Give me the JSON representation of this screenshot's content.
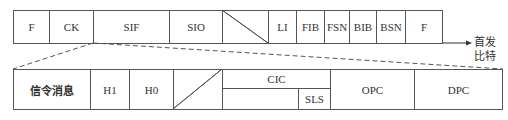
{
  "diagram": {
    "top_frame": {
      "fields": [
        {
          "label": "F"
        },
        {
          "label": "CK"
        },
        {
          "label": "SIF"
        },
        {
          "label": "SIO"
        },
        {
          "label": ""
        },
        {
          "label": "LI"
        },
        {
          "label": "FIB"
        },
        {
          "label": "FSN"
        },
        {
          "label": "BIB"
        },
        {
          "label": "BSN"
        },
        {
          "label": "F"
        }
      ],
      "direction_label_line1": "首发",
      "direction_label_line2": "比特"
    },
    "sif_expansion": {
      "fields": [
        {
          "label": "信令消息"
        },
        {
          "label": "H1"
        },
        {
          "label": "H0"
        },
        {
          "label": ""
        },
        {
          "label": "CIC"
        },
        {
          "label": "SLS"
        },
        {
          "label": "OPC"
        },
        {
          "label": "DPC"
        }
      ]
    }
  }
}
